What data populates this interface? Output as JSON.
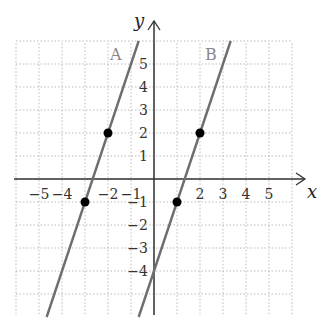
{
  "chart_data": {
    "type": "line",
    "title": "",
    "xlabel": "x",
    "ylabel": "y",
    "xlim": [
      -6,
      6
    ],
    "ylim": [
      -6,
      6
    ],
    "grid": true,
    "x_ticks": [
      "-5",
      "-4",
      "-2",
      "-1",
      "2",
      "3",
      "4",
      "5"
    ],
    "y_ticks": [
      "5",
      "4",
      "3",
      "2",
      "1",
      "-1",
      "-2",
      "-3",
      "-4"
    ],
    "series": [
      {
        "name": "A",
        "equation": "y = 3x + 8",
        "points": [
          [
            -2,
            2
          ],
          [
            -3,
            -1
          ]
        ]
      },
      {
        "name": "B",
        "equation": "y = 3x - 4",
        "points": [
          [
            2,
            2
          ],
          [
            1,
            -1
          ]
        ]
      }
    ],
    "colors": {
      "line": "#6e6e6e",
      "point": "#000000",
      "grid": "#bbbbbb",
      "axis": "#333333"
    }
  },
  "labels": {
    "x_axis": "x",
    "y_axis": "y",
    "line_a": "A",
    "line_b": "B"
  }
}
